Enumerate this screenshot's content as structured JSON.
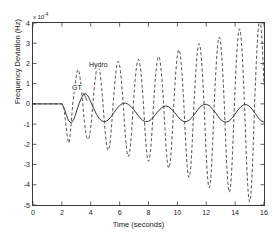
{
  "chart_data": {
    "type": "line",
    "title": "",
    "xlabel": "Time (seconds)",
    "ylabel": "Frequency Deviation (Hz)",
    "y_multiplier_text": "x 10",
    "y_multiplier_exponent": "-4",
    "xlim": [
      0,
      16
    ],
    "ylim": [
      -5,
      4
    ],
    "xticks": [
      0,
      2,
      4,
      6,
      8,
      10,
      12,
      14,
      16
    ],
    "yticks": [
      -5,
      -4,
      -3,
      -2,
      -1,
      0,
      1,
      2,
      3,
      4
    ],
    "xtick_labels": [
      "0",
      "2",
      "4",
      "6",
      "8",
      "10",
      "12",
      "14",
      "16"
    ],
    "ytick_labels": [
      "-5",
      "-4",
      "-3",
      "-2",
      "-1",
      "0",
      "1",
      "2",
      "3",
      "4"
    ],
    "grid": false,
    "legend_position": "in-plot-annotations",
    "annotations": [
      {
        "text": "Hydro",
        "x": 4.0,
        "y": 2.05,
        "series": "Hydro"
      },
      {
        "text": "GT",
        "x": 3.35,
        "y": 0.72,
        "series": "GT"
      }
    ],
    "series": [
      {
        "name": "GT",
        "style": "solid",
        "color": "#222222",
        "description": "Gas turbine response: flat at zero until t=2 s, then a damped oscillation settling toward about -0.45e-4 Hz with bounded ripple between roughly 0 and -1e-4.",
        "x": [
          0,
          0.25,
          0.5,
          0.75,
          1,
          1.25,
          1.5,
          1.75,
          2,
          2.1,
          2.2,
          2.3,
          2.4,
          2.5,
          2.6,
          2.7,
          2.8,
          2.9,
          3,
          3.1,
          3.2,
          3.3,
          3.4,
          3.5,
          3.6,
          3.7,
          3.8,
          3.9,
          4,
          4.2,
          4.4,
          4.6,
          4.8,
          5,
          5.2,
          5.4,
          5.6,
          5.8,
          6,
          6.2,
          6.4,
          6.6,
          6.8,
          7,
          7.2,
          7.4,
          7.6,
          7.8,
          8,
          8.2,
          8.4,
          8.6,
          8.8,
          9,
          9.2,
          9.4,
          9.6,
          9.8,
          10,
          10.2,
          10.4,
          10.6,
          10.8,
          11,
          11.2,
          11.4,
          11.6,
          11.8,
          12,
          12.2,
          12.4,
          12.6,
          12.8,
          13,
          13.2,
          13.4,
          13.6,
          13.8,
          14,
          14.2,
          14.4,
          14.6,
          14.8,
          15,
          15.2,
          15.4,
          15.6,
          15.8,
          16
        ],
        "y": [
          0,
          0,
          0,
          0,
          0,
          0,
          0,
          0,
          0,
          -0.12,
          -0.3,
          -0.52,
          -0.72,
          -0.86,
          -0.92,
          -0.9,
          -0.8,
          -0.62,
          -0.4,
          -0.18,
          0.02,
          0.2,
          0.36,
          0.46,
          0.5,
          0.48,
          0.4,
          0.26,
          0.1,
          -0.22,
          -0.52,
          -0.74,
          -0.86,
          -0.88,
          -0.8,
          -0.64,
          -0.44,
          -0.24,
          -0.08,
          0.02,
          0.04,
          -0.02,
          -0.14,
          -0.3,
          -0.5,
          -0.68,
          -0.82,
          -0.88,
          -0.86,
          -0.76,
          -0.6,
          -0.42,
          -0.26,
          -0.14,
          -0.1,
          -0.14,
          -0.26,
          -0.42,
          -0.6,
          -0.76,
          -0.86,
          -0.88,
          -0.82,
          -0.68,
          -0.5,
          -0.3,
          -0.14,
          -0.04,
          -0.02,
          -0.08,
          -0.22,
          -0.4,
          -0.6,
          -0.78,
          -0.88,
          -0.9,
          -0.84,
          -0.7,
          -0.5,
          -0.3,
          -0.14,
          -0.04,
          -0.04,
          -0.12,
          -0.28,
          -0.48,
          -0.68,
          -0.84,
          -0.9
        ]
      },
      {
        "name": "Hydro",
        "style": "dashed",
        "color": "#333333",
        "description": "Hydro response: flat at zero until t=2 s, then a growing (unstable) oscillation whose amplitude increases from about 2e-4 to beyond the -5e-4 / +3.8e-4 axis limits by t=16 s; period about 1.4 s.",
        "period_seconds": 1.4,
        "peak_amplitudes": [
          {
            "t": 3.1,
            "y": 1.7
          },
          {
            "t": 4.5,
            "y": 1.9
          },
          {
            "t": 5.9,
            "y": 2.1
          },
          {
            "t": 7.3,
            "y": 2.2
          },
          {
            "t": 8.8,
            "y": 2.35
          },
          {
            "t": 10.2,
            "y": 2.7
          },
          {
            "t": 11.6,
            "y": 3.0
          },
          {
            "t": 13.1,
            "y": 3.35
          },
          {
            "t": 14.6,
            "y": 3.8
          }
        ],
        "trough_amplitudes": [
          {
            "t": 2.5,
            "y": -2.15
          },
          {
            "t": 3.8,
            "y": -1.75
          },
          {
            "t": 5.2,
            "y": -2.3
          },
          {
            "t": 6.6,
            "y": -2.6
          },
          {
            "t": 8.1,
            "y": -2.85
          },
          {
            "t": 9.5,
            "y": -3.2
          },
          {
            "t": 11.0,
            "y": -3.7
          },
          {
            "t": 12.5,
            "y": -4.25
          },
          {
            "t": 13.9,
            "y": -4.4
          },
          {
            "t": 15.4,
            "y": -5.0
          }
        ]
      }
    ]
  },
  "axes": {
    "xlabel": "Time (seconds)",
    "ylabel": "Frequency Deviation (Hz)",
    "multiplier_prefix": "x 10",
    "multiplier_exponent": "-4"
  },
  "annotations": {
    "hydro": "Hydro",
    "gt": "GT"
  }
}
